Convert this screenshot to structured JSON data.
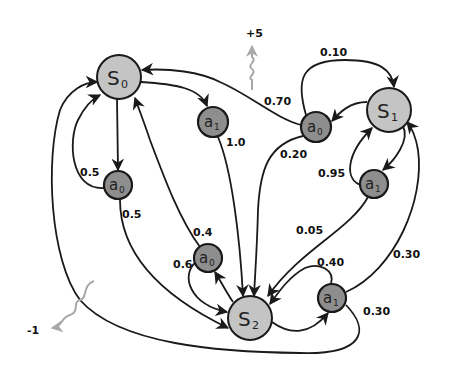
{
  "diagram": {
    "type": "markov-decision-process",
    "colors": {
      "state_fill": "#c4c4c4",
      "action_fill": "#8e8e8e",
      "edge": "#1a1a1a",
      "reward_arrow": "#a8a8a8"
    },
    "states": [
      {
        "id": "S0",
        "name": "S",
        "sub": "0"
      },
      {
        "id": "S1",
        "name": "S",
        "sub": "1"
      },
      {
        "id": "S2",
        "name": "S",
        "sub": "2"
      }
    ],
    "actions": [
      {
        "id": "S0_a0",
        "name": "a",
        "sub": "0",
        "state": "S0"
      },
      {
        "id": "S0_a1",
        "name": "a",
        "sub": "1",
        "state": "S0"
      },
      {
        "id": "S1_a0",
        "name": "a",
        "sub": "0",
        "state": "S1"
      },
      {
        "id": "S1_a1",
        "name": "a",
        "sub": "1",
        "state": "S1"
      },
      {
        "id": "S2_a0",
        "name": "a",
        "sub": "0",
        "state": "S2"
      },
      {
        "id": "S2_a1",
        "name": "a",
        "sub": "1",
        "state": "S2"
      }
    ],
    "transitions": [
      {
        "from": "S0_a0",
        "to": "S0",
        "prob": "0.5"
      },
      {
        "from": "S0_a0",
        "to": "S2",
        "prob": "0.5"
      },
      {
        "from": "S0_a1",
        "to": "S2",
        "prob": "1.0"
      },
      {
        "from": "S1_a0",
        "to": "S0",
        "prob": "0.70"
      },
      {
        "from": "S1_a0",
        "to": "S1",
        "prob": "0.10"
      },
      {
        "from": "S1_a0",
        "to": "S2",
        "prob": "0.20"
      },
      {
        "from": "S1_a1",
        "to": "S1",
        "prob": "0.95"
      },
      {
        "from": "S1_a1",
        "to": "S2",
        "prob": "0.05"
      },
      {
        "from": "S2_a0",
        "to": "S0",
        "prob": "0.4"
      },
      {
        "from": "S2_a0",
        "to": "S2",
        "prob": "0.6"
      },
      {
        "from": "S2_a1",
        "to": "S1",
        "prob": "0.30"
      },
      {
        "from": "S2_a1",
        "to": "S2",
        "prob": "0.40"
      },
      {
        "from": "S2_a1",
        "to": "S0",
        "prob": "0.30"
      }
    ],
    "rewards": [
      {
        "label": "+5",
        "on": "S1_a0 -> S0"
      },
      {
        "label": "-1",
        "on": "S2_a1 -> S0"
      }
    ]
  }
}
